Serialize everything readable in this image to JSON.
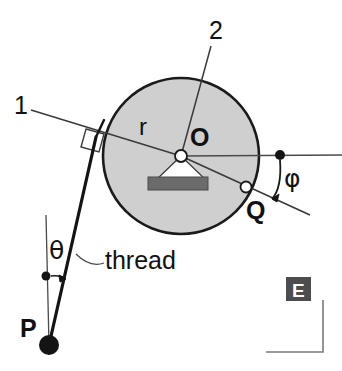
{
  "figure": {
    "type": "physics-mechanics-diagram",
    "background_color": "#ffffff",
    "stroke_color": "#1a1a1a",
    "disc_fill_color": "#cfcfcf",
    "block_fill_color": "#6b6b6b",
    "ebox_fill_color": "#4d4d4d"
  },
  "labels": {
    "line_one": "1",
    "line_two": "2",
    "radius": "r",
    "center": "O",
    "point_q": "Q",
    "point_p": "P",
    "angle_phi": "φ",
    "angle_theta": "θ",
    "thread": "thread",
    "corner_badge": "E"
  },
  "geometry": {
    "disc": {
      "cx": 181,
      "cy": 156,
      "r": 78
    },
    "center_dot": {
      "cx": 181,
      "cy": 156,
      "r": 6
    },
    "point_q": {
      "cx": 246,
      "cy": 187,
      "r": 5.5
    },
    "point_p": {
      "cx": 49,
      "cy": 345,
      "r": 10
    },
    "phi_vertex_dot": {
      "cx": 280,
      "cy": 155,
      "r": 5
    },
    "theta_vertex_dot": {
      "cx": 46,
      "cy": 276,
      "r": 4.5
    },
    "block": {
      "x": 148,
      "y": 177,
      "w": 60,
      "h": 13
    },
    "right_angle_marker": {
      "x": 85,
      "y": 128,
      "size": 18
    },
    "ebox": {
      "x": 286,
      "y": 277,
      "w": 25,
      "h": 24
    },
    "corner_rule": {
      "vx": 323,
      "y_top": 300,
      "y_bottom": 352,
      "x_left": 266
    }
  },
  "annotations": {
    "line_one_note": "Tangent reference line 1, perpendicular to the thread",
    "line_two_note": "Reference line 2 through the disc centre O",
    "phi_note": "Angle phi between the horizontal through O and the line O-Q extended",
    "theta_note": "Angle theta between the vertical through P and the thread"
  }
}
